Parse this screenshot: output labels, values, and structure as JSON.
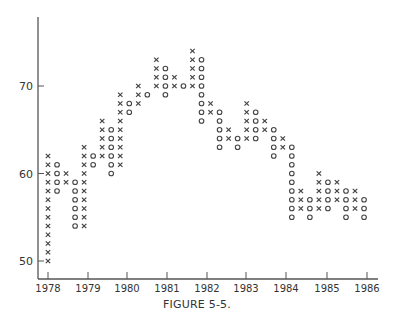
{
  "chart_data": {
    "type": "scatter",
    "subtype": "point-and-figure",
    "title": "",
    "caption": "FIGURE 5-5.",
    "xlabel": "",
    "ylabel": "",
    "x_tick_labels": [
      "1978",
      "1979",
      "1980",
      "1981",
      "1982",
      "1983",
      "1984",
      "1985",
      "1986"
    ],
    "y_tick_labels": [
      "50",
      "60",
      "70"
    ],
    "ylim": [
      48,
      76
    ],
    "grid": false,
    "box_size": 1,
    "columns": [
      {
        "type": "X",
        "low": 50,
        "high": 62
      },
      {
        "type": "O",
        "low": 58,
        "high": 61
      },
      {
        "type": "X",
        "low": 59,
        "high": 60
      },
      {
        "type": "O",
        "low": 54,
        "high": 59
      },
      {
        "type": "X",
        "low": 54,
        "high": 63
      },
      {
        "type": "O",
        "low": 61,
        "high": 62
      },
      {
        "type": "X",
        "low": 62,
        "high": 66
      },
      {
        "type": "O",
        "low": 60,
        "high": 65
      },
      {
        "type": "X",
        "low": 61,
        "high": 69
      },
      {
        "type": "O",
        "low": 67,
        "high": 68
      },
      {
        "type": "X",
        "low": 68,
        "high": 70
      },
      {
        "type": "O",
        "low": 69,
        "high": 69
      },
      {
        "type": "X",
        "low": 70,
        "high": 73
      },
      {
        "type": "O",
        "low": 69,
        "high": 72
      },
      {
        "type": "X",
        "low": 70,
        "high": 71
      },
      {
        "type": "O",
        "low": 70,
        "high": 70
      },
      {
        "type": "X",
        "low": 70,
        "high": 74
      },
      {
        "type": "O",
        "low": 66,
        "high": 73
      },
      {
        "type": "X",
        "low": 67,
        "high": 68
      },
      {
        "type": "O",
        "low": 63,
        "high": 67
      },
      {
        "type": "X",
        "low": 64,
        "high": 65
      },
      {
        "type": "O",
        "low": 63,
        "high": 64
      },
      {
        "type": "X",
        "low": 64,
        "high": 68
      },
      {
        "type": "O",
        "low": 64,
        "high": 67
      },
      {
        "type": "X",
        "low": 65,
        "high": 66
      },
      {
        "type": "O",
        "low": 62,
        "high": 65
      },
      {
        "type": "X",
        "low": 63,
        "high": 64
      },
      {
        "type": "O",
        "low": 55,
        "high": 63
      },
      {
        "type": "X",
        "low": 56,
        "high": 58
      },
      {
        "type": "O",
        "low": 55,
        "high": 57
      },
      {
        "type": "X",
        "low": 56,
        "high": 60
      },
      {
        "type": "O",
        "low": 56,
        "high": 59
      },
      {
        "type": "X",
        "low": 57,
        "high": 59
      },
      {
        "type": "O",
        "low": 55,
        "high": 58
      },
      {
        "type": "X",
        "low": 56,
        "high": 58
      },
      {
        "type": "O",
        "low": 55,
        "high": 57
      }
    ]
  },
  "caption": "FIGURE 5-5."
}
